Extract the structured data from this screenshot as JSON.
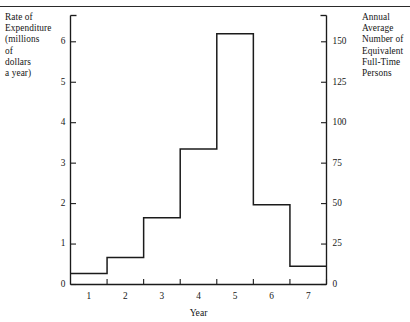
{
  "figure": {
    "left_axis_caption": "Rate of Expenditure (millions of dollars a year)",
    "left_axis_caption_lines": [
      "Rate of",
      "Expenditure",
      "(millions",
      "of",
      "dollars",
      "a year)"
    ],
    "right_axis_caption": "Annual Average Number of Equivalent Full-Time Persons",
    "right_axis_caption_lines": [
      "Annual",
      "Average",
      "Number of",
      "Equivalent",
      "Full-Time",
      "Persons"
    ],
    "x_axis_title": "Year"
  },
  "chart_data": {
    "type": "line",
    "subtype": "step",
    "title": "",
    "xlabel": "Year",
    "ylabel": "Rate of Expenditure (millions of dollars a year)",
    "y2label": "Annual Average Number of Equivalent Full-Time Persons",
    "xlim": [
      0.5,
      7.5
    ],
    "ylim": [
      0,
      6.65
    ],
    "y2lim": [
      0,
      150
    ],
    "grid": false,
    "legend": null,
    "xticks": [
      1.5,
      2.5,
      3.5,
      4.5,
      5.5,
      6.5,
      7.5
    ],
    "xticklabels": [
      "1",
      "2",
      "3",
      "4",
      "5",
      "6",
      "7"
    ],
    "xticklabel_positions": [
      1.0,
      2.0,
      3.0,
      4.0,
      5.0,
      6.0,
      7.0
    ],
    "yticks": [
      0,
      1,
      2,
      3,
      4,
      5,
      6
    ],
    "yticklabels": [
      "0",
      "1",
      "2",
      "3",
      "4",
      "5",
      "6"
    ],
    "y2ticks": [
      0,
      25,
      50,
      75,
      100,
      125,
      150
    ],
    "y2ticklabels": [
      "0",
      "25",
      "50",
      "75",
      "100",
      "125",
      "150"
    ],
    "conversion_ratio_y2_per_y": 25,
    "categories": [
      "1",
      "2",
      "3",
      "4",
      "5",
      "6",
      "7"
    ],
    "values": [
      0.27,
      0.67,
      1.65,
      3.35,
      6.2,
      1.97,
      0.45
    ],
    "values_right_axis": [
      6.75,
      16.75,
      41.25,
      83.75,
      155,
      49.25,
      11.25
    ],
    "step_intervals": [
      {
        "x_start": 0.5,
        "x_end": 1.5,
        "y": 0.27
      },
      {
        "x_start": 1.5,
        "x_end": 2.5,
        "y": 0.67
      },
      {
        "x_start": 2.5,
        "x_end": 3.5,
        "y": 1.65
      },
      {
        "x_start": 3.5,
        "x_end": 4.5,
        "y": 3.35
      },
      {
        "x_start": 4.5,
        "x_end": 5.5,
        "y": 6.2
      },
      {
        "x_start": 5.5,
        "x_end": 6.5,
        "y": 1.97
      },
      {
        "x_start": 6.5,
        "x_end": 7.5,
        "y": 0.45
      }
    ],
    "line_color": "#1b1b1b"
  }
}
